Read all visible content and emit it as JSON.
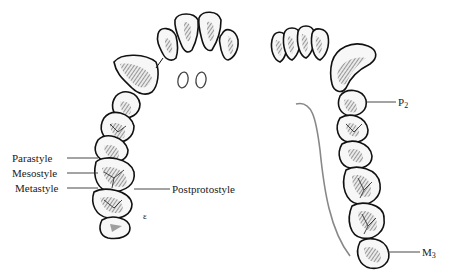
{
  "figure": {
    "type": "dental arch illustration",
    "left_arch": {
      "description": "upper dentition, occlusal view, incisors to molars",
      "labels": [
        {
          "id": "parastyle",
          "text": "Parastyle"
        },
        {
          "id": "mesostyle",
          "text": "Mesostyle"
        },
        {
          "id": "metastyle",
          "text": "Metastyle"
        },
        {
          "id": "postprotostyle",
          "text": "Postprotostyle"
        }
      ],
      "small_mark": "ε"
    },
    "right_arch": {
      "description": "lower dentition, occlusal view",
      "labels": [
        {
          "id": "p2",
          "text": "P",
          "subscript": "2"
        },
        {
          "id": "m3",
          "text": "M",
          "subscript": "3"
        }
      ]
    },
    "colors": {
      "outline": "#111111",
      "shading": "#555555",
      "background": "#ffffff",
      "text": "#1a1a1a"
    }
  }
}
